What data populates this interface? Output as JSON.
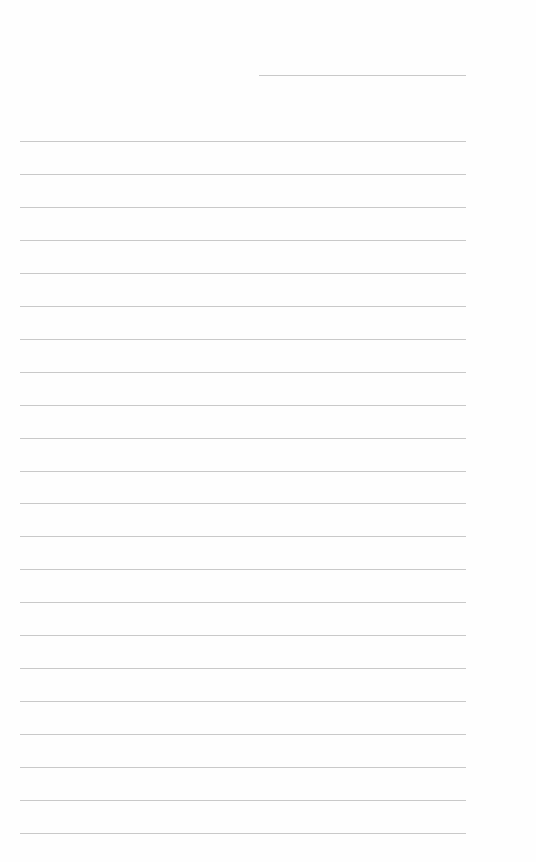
{
  "page": {
    "type": "lined-paper",
    "background_color": "#fefefe",
    "line_color": "#c9c9c9",
    "header_line": {
      "x": 259,
      "y": 75,
      "width": 207
    },
    "lines": {
      "count": 22,
      "left": 20,
      "width": 446,
      "first_y": 141,
      "spacing": 32.95
    }
  }
}
